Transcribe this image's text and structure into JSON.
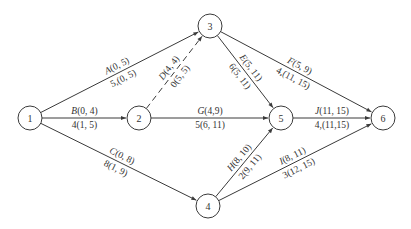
{
  "diagram": {
    "type": "activity-on-arrow network",
    "nodes": [
      {
        "id": "1",
        "x": 30,
        "y": 118
      },
      {
        "id": "2",
        "x": 139,
        "y": 118
      },
      {
        "id": "3",
        "x": 210,
        "y": 26
      },
      {
        "id": "4",
        "x": 208,
        "y": 206
      },
      {
        "id": "5",
        "x": 281,
        "y": 118
      },
      {
        "id": "6",
        "x": 383,
        "y": 118
      }
    ],
    "edges": [
      {
        "from": "1",
        "to": "3",
        "activity": "A",
        "top": "(0, 5)",
        "bottom": "5,(0, 5)",
        "dashed": false
      },
      {
        "from": "1",
        "to": "2",
        "activity": "B",
        "top": "(0, 4)",
        "bottom": "4(1, 5)",
        "dashed": false
      },
      {
        "from": "1",
        "to": "4",
        "activity": "C",
        "top": "(0, 8)",
        "bottom": "8(1, 9)",
        "dashed": false
      },
      {
        "from": "2",
        "to": "3",
        "activity": "D",
        "top": "(4, 4)",
        "bottom": "0(5, 5)",
        "dashed": true
      },
      {
        "from": "3",
        "to": "5",
        "activity": "E",
        "top": "(5, 11)",
        "bottom": "6(5, 11)",
        "dashed": false
      },
      {
        "from": "3",
        "to": "6",
        "activity": "F",
        "top": "(5, 9)",
        "bottom": "4,(11, 15)",
        "dashed": false
      },
      {
        "from": "2",
        "to": "5",
        "activity": "G",
        "top": "(4,9)",
        "bottom": "5(6, 11)",
        "dashed": false
      },
      {
        "from": "4",
        "to": "5",
        "activity": "H",
        "top": "(8, 10)",
        "bottom": "2(9, 11)",
        "dashed": false
      },
      {
        "from": "4",
        "to": "6",
        "activity": "I",
        "top": "(8, 11)",
        "bottom": "3(12, 15)",
        "dashed": false
      },
      {
        "from": "5",
        "to": "6",
        "activity": "J",
        "top": "(11, 15)",
        "bottom": "4,(11,15)",
        "dashed": false
      }
    ]
  }
}
